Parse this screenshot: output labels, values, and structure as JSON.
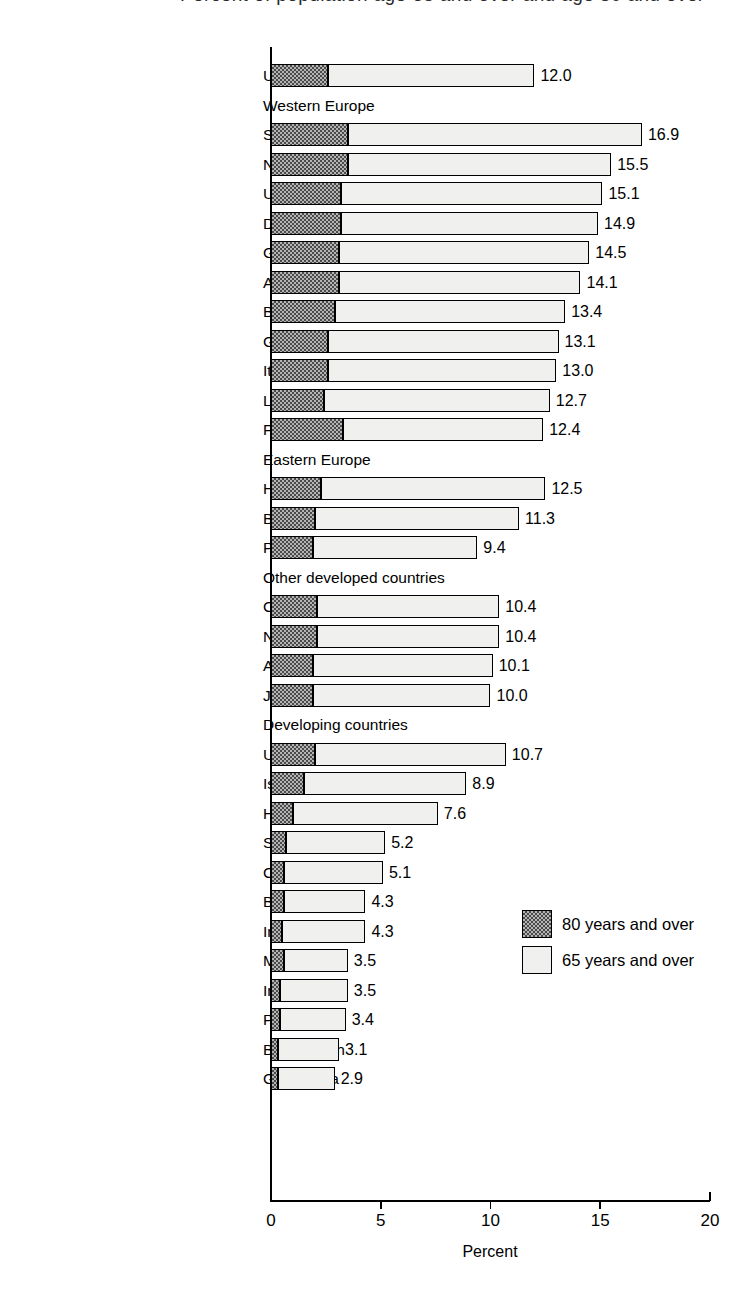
{
  "chart_data": {
    "type": "bar",
    "orientation": "horizontal",
    "stacked": false,
    "title": "",
    "xlabel": "Percent",
    "ylabel": "",
    "xlim": [
      0,
      20
    ],
    "xticks": [
      0,
      5,
      10,
      15,
      20
    ],
    "xtick_labels": [
      "0",
      "5",
      "10",
      "15",
      "20"
    ],
    "grid": false,
    "legend_position": "middle-right",
    "legend": [
      {
        "key": "age80",
        "label": "80 years and over",
        "fill": "dark-checker"
      },
      {
        "key": "age65",
        "label": "65 years and over",
        "fill": "light-stipple"
      }
    ],
    "series": [
      {
        "name": "80 years and over",
        "key": "age80"
      },
      {
        "name": "65 years and over",
        "key": "age65"
      }
    ],
    "rows": [
      {
        "label": "United States",
        "type": "bar",
        "age65": 12.0,
        "age80": 2.6,
        "value_label": "12.0"
      },
      {
        "label": "Western Europe",
        "type": "group",
        "age65": null,
        "age80": null,
        "value_label": ""
      },
      {
        "label": "Sweden",
        "type": "bar",
        "age65": 16.9,
        "age80": 3.5,
        "value_label": "16.9"
      },
      {
        "label": "Norway",
        "type": "bar",
        "age65": 15.5,
        "age80": 3.5,
        "value_label": "15.5"
      },
      {
        "label": "United Kingdom",
        "type": "bar",
        "age65": 15.1,
        "age80": 3.2,
        "value_label": "15.1"
      },
      {
        "label": "Denmark",
        "type": "bar",
        "age65": 14.9,
        "age80": 3.2,
        "value_label": "14.9"
      },
      {
        "label": "Germany",
        "type": "bar",
        "age65": 14.5,
        "age80": 3.1,
        "value_label": "14.5"
      },
      {
        "label": "Austria",
        "type": "bar",
        "age65": 14.1,
        "age80": 3.1,
        "value_label": "14.1"
      },
      {
        "label": "Belgium",
        "type": "bar",
        "age65": 13.4,
        "age80": 2.9,
        "value_label": "13.4"
      },
      {
        "label": "Greece",
        "type": "bar",
        "age65": 13.1,
        "age80": 2.6,
        "value_label": "13.1"
      },
      {
        "label": "Italy",
        "type": "bar",
        "age65": 13.0,
        "age80": 2.6,
        "value_label": "13.0"
      },
      {
        "label": "Luxembourg",
        "type": "bar",
        "age65": 12.7,
        "age80": 2.4,
        "value_label": "12.7"
      },
      {
        "label": "France",
        "type": "bar",
        "age65": 12.4,
        "age80": 3.3,
        "value_label": "12.4"
      },
      {
        "label": "Eastern Europe",
        "type": "group",
        "age65": null,
        "age80": null,
        "value_label": ""
      },
      {
        "label": "Hungary",
        "type": "bar",
        "age65": 12.5,
        "age80": 2.3,
        "value_label": "12.5"
      },
      {
        "label": "Bulgaria",
        "type": "bar",
        "age65": 11.3,
        "age80": 2.0,
        "value_label": "11.3"
      },
      {
        "label": "Poland",
        "type": "bar",
        "age65": 9.4,
        "age80": 1.9,
        "value_label": "9.4"
      },
      {
        "label": "Other developed countries",
        "type": "group",
        "age65": null,
        "age80": null,
        "value_label": ""
      },
      {
        "label": "Canada",
        "type": "bar",
        "age65": 10.4,
        "age80": 2.1,
        "value_label": "10.4"
      },
      {
        "label": "New Zealand",
        "type": "bar",
        "age65": 10.4,
        "age80": 2.1,
        "value_label": "10.4"
      },
      {
        "label": "Australia",
        "type": "bar",
        "age65": 10.1,
        "age80": 1.9,
        "value_label": "10.1"
      },
      {
        "label": "Japan",
        "type": "bar",
        "age65": 10.0,
        "age80": 1.9,
        "value_label": "10.0"
      },
      {
        "label": "Developing countries",
        "type": "group",
        "age65": null,
        "age80": null,
        "value_label": ""
      },
      {
        "label": "Uruguay",
        "type": "bar",
        "age65": 10.7,
        "age80": 2.0,
        "value_label": "10.7"
      },
      {
        "label": "Israel",
        "type": "bar",
        "age65": 8.9,
        "age80": 1.5,
        "value_label": "8.9"
      },
      {
        "label": "Hong Kong",
        "type": "bar",
        "age65": 7.6,
        "age80": 1.0,
        "value_label": "7.6"
      },
      {
        "label": "Singapore",
        "type": "bar",
        "age65": 5.2,
        "age80": 0.7,
        "value_label": "5.2"
      },
      {
        "label": "China",
        "type": "bar",
        "age65": 5.1,
        "age80": 0.6,
        "value_label": "5.1"
      },
      {
        "label": "Brazil",
        "type": "bar",
        "age65": 4.3,
        "age80": 0.6,
        "value_label": "4.3"
      },
      {
        "label": "India",
        "type": "bar",
        "age65": 4.3,
        "age80": 0.5,
        "value_label": "4.3"
      },
      {
        "label": "Mexico",
        "type": "bar",
        "age65": 3.5,
        "age80": 0.6,
        "value_label": "3.5"
      },
      {
        "label": "Indonesia",
        "type": "bar",
        "age65": 3.5,
        "age80": 0.4,
        "value_label": "3.5"
      },
      {
        "label": "Philippines",
        "type": "bar",
        "age65": 3.4,
        "age80": 0.4,
        "value_label": "3.4"
      },
      {
        "label": "Bangladesh",
        "type": "bar",
        "age65": 3.1,
        "age80": 0.3,
        "value_label": "3.1"
      },
      {
        "label": "Guatemala",
        "type": "bar",
        "age65": 2.9,
        "age80": 0.3,
        "value_label": "2.9"
      }
    ]
  },
  "axis": {
    "x_title": "Percent",
    "tick_labels": [
      "0",
      "5",
      "10",
      "15",
      "20"
    ]
  },
  "legend": {
    "items": [
      {
        "label": "80 years and over"
      },
      {
        "label": "65 years and over"
      }
    ]
  },
  "colors": {
    "ink": "#000000",
    "dark_fill": "#4a4a4a",
    "light_fill": "#f0f0ee",
    "background": "#ffffff"
  }
}
